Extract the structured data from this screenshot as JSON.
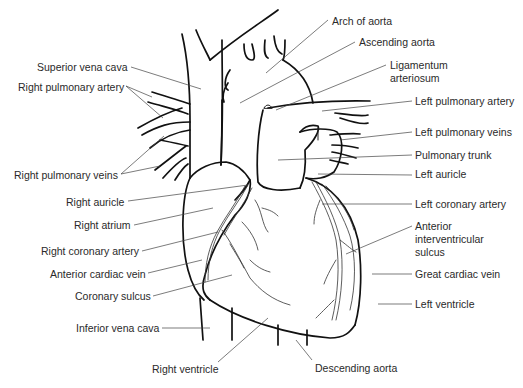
{
  "diagram": {
    "labels_left": [
      {
        "id": "superior-vena-cava",
        "text": "Superior vena cava",
        "x": 37,
        "y": 60
      },
      {
        "id": "right-pulmonary-artery",
        "text": "Right pulmonary artery",
        "x": 18,
        "y": 81
      },
      {
        "id": "right-pulmonary-veins",
        "text": "Right pulmonary veins",
        "x": 14,
        "y": 169
      },
      {
        "id": "right-auricle",
        "text": "Right auricle",
        "x": 66,
        "y": 196
      },
      {
        "id": "right-atrium",
        "text": "Right atrium",
        "x": 74,
        "y": 219
      },
      {
        "id": "right-coronary-artery",
        "text": "Right coronary artery",
        "x": 41,
        "y": 245
      },
      {
        "id": "anterior-cardiac-vein",
        "text": "Anterior cardiac vein",
        "x": 50,
        "y": 268
      },
      {
        "id": "coronary-sulcus",
        "text": "Coronary sulcus",
        "x": 75,
        "y": 290
      },
      {
        "id": "inferior-vena-cava",
        "text": "Inferior vena cava",
        "x": 76,
        "y": 322
      },
      {
        "id": "right-ventricle",
        "text": "Right ventricle",
        "x": 152,
        "y": 363
      }
    ],
    "labels_right": [
      {
        "id": "arch-of-aorta",
        "text": "Arch of aorta",
        "x": 332,
        "y": 15
      },
      {
        "id": "ascending-aorta",
        "text": "Ascending aorta",
        "x": 359,
        "y": 36
      },
      {
        "id": "ligamentum-arteriosum-1",
        "text": "Ligamentum",
        "x": 390,
        "y": 59
      },
      {
        "id": "ligamentum-arteriosum-2",
        "text": "arteriosum",
        "x": 390,
        "y": 72
      },
      {
        "id": "left-pulmonary-artery",
        "text": "Left pulmonary artery",
        "x": 415,
        "y": 95
      },
      {
        "id": "left-pulmonary-veins",
        "text": "Left pulmonary veins",
        "x": 415,
        "y": 126
      },
      {
        "id": "pulmonary-trunk",
        "text": "Pulmonary trunk",
        "x": 415,
        "y": 149
      },
      {
        "id": "left-auricle",
        "text": "Left auricle",
        "x": 415,
        "y": 168
      },
      {
        "id": "left-coronary-artery",
        "text": "Left coronary artery",
        "x": 415,
        "y": 198
      },
      {
        "id": "anterior-interventricular-sulcus-1",
        "text": "Anterior",
        "x": 415,
        "y": 220
      },
      {
        "id": "anterior-interventricular-sulcus-2",
        "text": "interventricular",
        "x": 415,
        "y": 233
      },
      {
        "id": "anterior-interventricular-sulcus-3",
        "text": "sulcus",
        "x": 415,
        "y": 246
      },
      {
        "id": "great-cardiac-vein",
        "text": "Great cardiac vein",
        "x": 415,
        "y": 268
      },
      {
        "id": "left-ventricle",
        "text": "Left ventricle",
        "x": 415,
        "y": 298
      },
      {
        "id": "descending-aorta",
        "text": "Descending aorta",
        "x": 315,
        "y": 362
      }
    ]
  }
}
